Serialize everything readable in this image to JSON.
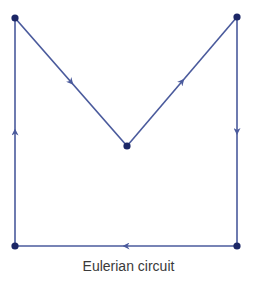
{
  "caption": "Eulerian circuit",
  "colors": {
    "edge": "#4a5a9c",
    "node": "#1c2766"
  },
  "nodes": [
    {
      "id": "top-left",
      "x": 15,
      "y": 18
    },
    {
      "id": "middle",
      "x": 127,
      "y": 146
    },
    {
      "id": "top-right",
      "x": 237,
      "y": 17
    },
    {
      "id": "bottom-right",
      "x": 237,
      "y": 246
    },
    {
      "id": "bottom-left",
      "x": 15,
      "y": 246
    }
  ],
  "edges": [
    {
      "from": "top-left",
      "to": "middle"
    },
    {
      "from": "middle",
      "to": "top-right"
    },
    {
      "from": "top-right",
      "to": "bottom-right"
    },
    {
      "from": "bottom-right",
      "to": "bottom-left"
    },
    {
      "from": "bottom-left",
      "to": "top-left"
    }
  ]
}
